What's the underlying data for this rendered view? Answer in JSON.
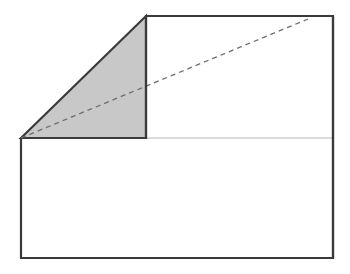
{
  "figure": {
    "background_color": "#ffffff",
    "canvas": {
      "width": 350,
      "height": 274
    },
    "style": {
      "outline_color": "#3a3a3a",
      "outline_width": 2.2,
      "divider_color": "#b9b9b9",
      "divider_width": 1.1,
      "shaded_fill": "#c8c8c8",
      "shaded_edge_color": "#3a3a3a",
      "dashed_color": "#6e6e6e",
      "dashed_width": 1.3,
      "dash_pattern": "5 4"
    },
    "points": {
      "lower_left_top": {
        "x": 21,
        "y": 138
      },
      "lower_left_bottom": {
        "x": 21,
        "y": 258
      },
      "lower_right_bottom": {
        "x": 333,
        "y": 258
      },
      "lower_right_top": {
        "x": 333,
        "y": 138
      },
      "upper_left_top": {
        "x": 146,
        "y": 16
      },
      "upper_right_top": {
        "x": 333,
        "y": 16
      },
      "upper_left_bottom": {
        "x": 146,
        "y": 138
      },
      "apex": {
        "x": 146,
        "y": 16
      },
      "dashed_start": {
        "x": 21,
        "y": 138
      },
      "dashed_end": {
        "x": 308,
        "y": 19
      }
    },
    "shapes": [
      {
        "name": "lower-rectangle",
        "kind": "rectangle",
        "points": "21,138 333,138 333,258 21,258",
        "fill": "#ffffff",
        "label": "Lower rectangle"
      },
      {
        "name": "upper-rectangle",
        "kind": "rectangle",
        "points": "146,16 333,16 333,138 146,138",
        "fill": "#ffffff",
        "label": "Upper rectangle"
      },
      {
        "name": "shaded-triangle",
        "kind": "right-triangle",
        "points": "21,138 146,16 146,138",
        "fill": "#c8c8c8",
        "label": "Shaded right triangle"
      }
    ],
    "paths": {
      "lower_rect_outline": "M 21 138 L 21 258 L 333 258 L 333 138",
      "upper_rect_outline": "M 146 138 L 146 16 L 333 16 L 333 138",
      "right_edge_full": "M 333 16 L 333 258",
      "divider_segment": "M 146 138 L 333 138",
      "triangle_outline": "M 21 138 L 146 16 L 146 138 Z",
      "triangle_base": "M 21 138 L 146 138",
      "dashed_diagonal": "M 21 138 L 308 19"
    },
    "annotations": []
  }
}
